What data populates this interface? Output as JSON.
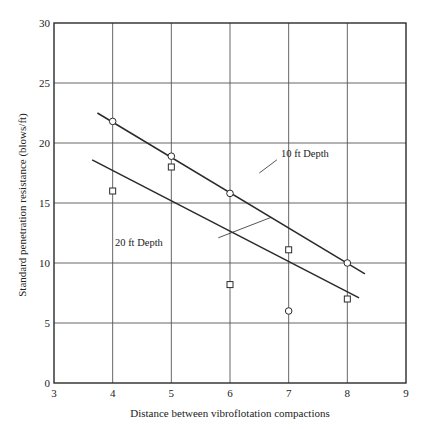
{
  "chart_data": {
    "type": "scatter",
    "title": "",
    "xlabel": "Distance between vibroflotation compactions",
    "ylabel": "Standard penetration resistance (blows/ft)",
    "xlim": [
      3,
      9
    ],
    "ylim": [
      0,
      30
    ],
    "x_ticks": [
      3,
      4,
      5,
      6,
      7,
      8,
      9
    ],
    "y_ticks": [
      0,
      5,
      10,
      15,
      20,
      25,
      30
    ],
    "grid": true,
    "legend": null,
    "series": [
      {
        "name": "10 ft Depth",
        "marker": "circle",
        "points": [
          {
            "x": 4,
            "y": 21.8
          },
          {
            "x": 5,
            "y": 18.9
          },
          {
            "x": 6,
            "y": 15.8
          },
          {
            "x": 7,
            "y": 6.0
          },
          {
            "x": 8,
            "y": 10.0
          }
        ],
        "fit_line": {
          "x0": 3.74,
          "y0": 22.5,
          "x1": 8.3,
          "y1": 9.1
        }
      },
      {
        "name": "20 ft Depth",
        "marker": "square",
        "points": [
          {
            "x": 4,
            "y": 16.0
          },
          {
            "x": 5,
            "y": 18.0
          },
          {
            "x": 6,
            "y": 8.2
          },
          {
            "x": 7,
            "y": 11.1
          },
          {
            "x": 8,
            "y": 7.0
          }
        ],
        "fit_line": {
          "x0": 3.65,
          "y0": 18.6,
          "x1": 8.2,
          "y1": 7.1
        }
      }
    ],
    "annotations": [
      {
        "text": "10 ft Depth",
        "text_x": 6.87,
        "text_y": 18.8,
        "arrow_from_x": 6.8,
        "arrow_from_y": 18.6,
        "arrow_to_x": 6.5,
        "arrow_to_y": 17.5
      },
      {
        "text": "20 ft Depth",
        "text_x": 4.04,
        "text_y": 11.4,
        "arrow_from_x": 5.8,
        "arrow_from_y": 12.1,
        "arrow_to_x": 6.7,
        "arrow_to_y": 13.8
      }
    ]
  },
  "style": {
    "line_color": "#2a2a2a",
    "grid_color": "#555555",
    "marker_fill": "#ffffff"
  }
}
